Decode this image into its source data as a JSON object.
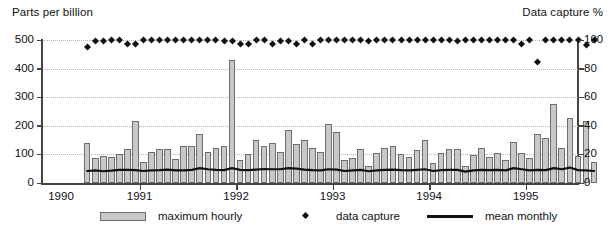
{
  "chart_data": {
    "type": "bar",
    "title": "",
    "ylabel": "Parts per billion",
    "ylabel_right": "Data capture %",
    "xlabel": "",
    "ylim": [
      0,
      500
    ],
    "ylim_right": [
      0,
      100
    ],
    "yticks": [
      0,
      100,
      200,
      300,
      400,
      500
    ],
    "yticks_right": [
      0,
      20,
      40,
      60,
      80,
      100
    ],
    "xtick_labels": [
      "1990",
      "1991",
      "1992",
      "1993",
      "1994",
      "1995"
    ],
    "xtick_positions": [
      0,
      12,
      24,
      36,
      48,
      60
    ],
    "grid": true,
    "x_start_index": 5,
    "n_points": 64,
    "legend_position": "below",
    "legend": [
      {
        "label": "maximum hourly",
        "marker": "bar"
      },
      {
        "label": "data capture",
        "marker": "diamond"
      },
      {
        "label": "mean monthly",
        "marker": "line"
      }
    ],
    "series": [
      {
        "name": "maximum hourly",
        "axis": "left",
        "values": [
          140,
          88,
          95,
          90,
          100,
          120,
          218,
          72,
          108,
          118,
          120,
          84,
          130,
          128,
          172,
          110,
          122,
          128,
          430,
          82,
          100,
          152,
          128,
          140,
          108,
          186,
          138,
          150,
          122,
          108,
          206,
          178,
          80,
          88,
          118,
          60,
          104,
          124,
          130,
          100,
          90,
          116,
          150,
          70,
          106,
          120,
          120,
          58,
          98,
          122,
          92,
          104,
          82,
          142,
          106,
          86,
          170,
          158,
          278,
          124,
          228,
          96,
          218,
          72
        ]
      },
      {
        "name": "mean monthly",
        "axis": "left",
        "values": [
          42,
          44,
          41,
          43,
          46,
          46,
          45,
          42,
          44,
          45,
          47,
          44,
          44,
          46,
          52,
          48,
          46,
          45,
          52,
          46,
          45,
          47,
          49,
          48,
          48,
          52,
          50,
          47,
          45,
          44,
          48,
          47,
          42,
          44,
          46,
          41,
          44,
          46,
          47,
          45,
          44,
          46,
          48,
          42,
          45,
          46,
          46,
          40,
          44,
          46,
          45,
          46,
          44,
          52,
          48,
          44,
          46,
          45,
          52,
          48,
          54,
          45,
          44,
          42
        ]
      },
      {
        "name": "data capture",
        "axis": "right",
        "values": [
          95,
          99,
          99,
          100,
          100,
          97,
          97,
          100,
          100,
          100,
          100,
          100,
          100,
          100,
          100,
          100,
          100,
          99,
          99,
          97,
          97,
          100,
          100,
          97,
          99,
          99,
          97,
          100,
          97,
          100,
          100,
          100,
          100,
          100,
          100,
          99,
          100,
          100,
          100,
          100,
          100,
          100,
          100,
          100,
          100,
          100,
          99,
          100,
          100,
          100,
          100,
          100,
          100,
          100,
          97,
          100,
          84,
          100,
          100,
          100,
          100,
          100,
          96,
          100
        ]
      }
    ]
  },
  "axis": {
    "left_title": "Parts per billion",
    "right_title": "Data capture %"
  }
}
